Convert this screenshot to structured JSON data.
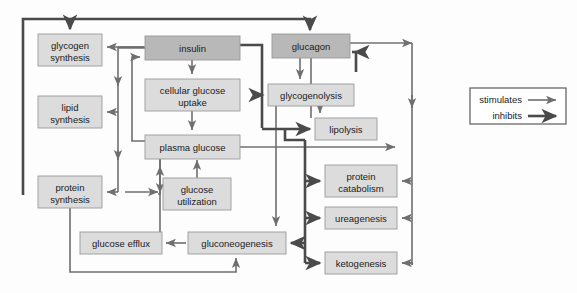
{
  "diagram": {
    "colors": {
      "hormone_fill": "#b8b8b8",
      "process_fill": "#dcdcdc",
      "box_stroke": "#9a9a9a",
      "stimulates_arrow": "#6f6f6f",
      "inhibits_arrow": "#4a4a4a",
      "text": "#1b1b1b",
      "background": "#fdfdfd"
    },
    "nodes": [
      {
        "id": "glycogen_synthesis",
        "label_line1": "glycogen",
        "label_line2": "synthesis",
        "type": "process",
        "x": 38,
        "y": 34,
        "w": 64,
        "h": 32
      },
      {
        "id": "lipid_synthesis",
        "label_line1": "lipid",
        "label_line2": "synthesis",
        "type": "process",
        "x": 38,
        "y": 96,
        "w": 64,
        "h": 32
      },
      {
        "id": "protein_synthesis",
        "label_line1": "protein",
        "label_line2": "synthesis",
        "type": "process",
        "x": 38,
        "y": 176,
        "w": 64,
        "h": 32
      },
      {
        "id": "insulin",
        "label_line1": "insulin",
        "label_line2": "",
        "type": "hormone",
        "x": 145,
        "y": 36,
        "w": 95,
        "h": 24
      },
      {
        "id": "cellular_glucose_uptake",
        "label_line1": "cellular glucose",
        "label_line2": "uptake",
        "type": "process",
        "x": 145,
        "y": 79,
        "w": 95,
        "h": 32
      },
      {
        "id": "plasma_glucose",
        "label_line1": "plasma glucose",
        "label_line2": "",
        "type": "process",
        "x": 145,
        "y": 135,
        "w": 95,
        "h": 24
      },
      {
        "id": "glucose_utilization",
        "label_line1": "glucose",
        "label_line2": "utilization",
        "type": "process",
        "x": 163,
        "y": 178,
        "w": 68,
        "h": 32
      },
      {
        "id": "glucose_efflux",
        "label_line1": "glucose efflux",
        "label_line2": "",
        "type": "process",
        "x": 80,
        "y": 232,
        "w": 82,
        "h": 22
      },
      {
        "id": "gluconeogenesis",
        "label_line1": "gluconeogenesis",
        "label_line2": "",
        "type": "process",
        "x": 188,
        "y": 232,
        "w": 98,
        "h": 22
      },
      {
        "id": "glucagon",
        "label_line1": "glucagon",
        "label_line2": "",
        "type": "hormone",
        "x": 272,
        "y": 34,
        "w": 78,
        "h": 24
      },
      {
        "id": "glycogenolysis",
        "label_line1": "glycogenolysis",
        "label_line2": "",
        "type": "process",
        "x": 268,
        "y": 84,
        "w": 86,
        "h": 22
      },
      {
        "id": "lipolysis",
        "label_line1": "lipolysis",
        "label_line2": "",
        "type": "process",
        "x": 315,
        "y": 118,
        "w": 62,
        "h": 22
      },
      {
        "id": "protein_catabolism",
        "label_line1": "protein",
        "label_line2": "catabolism",
        "type": "process",
        "x": 325,
        "y": 165,
        "w": 72,
        "h": 32
      },
      {
        "id": "ureagenesis",
        "label_line1": "ureagenesis",
        "label_line2": "",
        "type": "process",
        "x": 325,
        "y": 207,
        "w": 72,
        "h": 22
      },
      {
        "id": "ketogenesis",
        "label_line1": "ketogenesis",
        "label_line2": "",
        "type": "process",
        "x": 325,
        "y": 252,
        "w": 72,
        "h": 22
      }
    ],
    "legend": {
      "x": 470,
      "y": 88,
      "w": 96,
      "h": 36,
      "items": [
        {
          "label": "stimulates",
          "style": "thin",
          "color": "#6f6f6f"
        },
        {
          "label": "inhibits",
          "style": "thick",
          "color": "#4a4a4a"
        }
      ]
    },
    "edges": [
      {
        "from": "insulin",
        "to": "glycogen_synthesis",
        "relation": "stimulates"
      },
      {
        "from": "insulin",
        "to": "lipid_synthesis",
        "relation": "stimulates"
      },
      {
        "from": "insulin",
        "to": "protein_synthesis",
        "relation": "stimulates"
      },
      {
        "from": "insulin",
        "to": "cellular_glucose_uptake",
        "relation": "stimulates"
      },
      {
        "from": "cellular_glucose_uptake",
        "to": "plasma_glucose",
        "relation": "stimulates"
      },
      {
        "from": "plasma_glucose",
        "to": "insulin",
        "relation": "stimulates"
      },
      {
        "from": "plasma_glucose",
        "to": "glucose_utilization",
        "relation": "stimulates"
      },
      {
        "from": "glucose_utilization",
        "to": "plasma_glucose",
        "relation": "stimulates"
      },
      {
        "from": "gluconeogenesis",
        "to": "plasma_glucose",
        "relation": "stimulates"
      },
      {
        "from": "gluconeogenesis",
        "to": "glucose_efflux",
        "relation": "stimulates"
      },
      {
        "from": "protein_synthesis",
        "to": "gluconeogenesis",
        "relation": "stimulates"
      },
      {
        "from": "glucagon",
        "to": "glycogenolysis",
        "relation": "stimulates"
      },
      {
        "from": "glucagon",
        "to": "lipolysis",
        "relation": "stimulates"
      },
      {
        "from": "glucagon",
        "to": "protein_catabolism",
        "relation": "stimulates"
      },
      {
        "from": "glucagon",
        "to": "ureagenesis",
        "relation": "stimulates"
      },
      {
        "from": "glucagon",
        "to": "ketogenesis",
        "relation": "stimulates"
      },
      {
        "from": "glucagon",
        "to": "gluconeogenesis",
        "relation": "stimulates"
      },
      {
        "from": "plasma_glucose",
        "to": "glucagon",
        "relation": "inhibits"
      },
      {
        "from": "insulin",
        "to": "glycogenolysis",
        "relation": "inhibits"
      },
      {
        "from": "insulin",
        "to": "lipolysis",
        "relation": "inhibits"
      },
      {
        "from": "insulin",
        "to": "protein_catabolism",
        "relation": "inhibits"
      },
      {
        "from": "insulin",
        "to": "ureagenesis",
        "relation": "inhibits"
      },
      {
        "from": "insulin",
        "to": "ketogenesis",
        "relation": "inhibits"
      },
      {
        "from": "insulin",
        "to": "glucagon",
        "relation": "inhibits"
      }
    ]
  }
}
